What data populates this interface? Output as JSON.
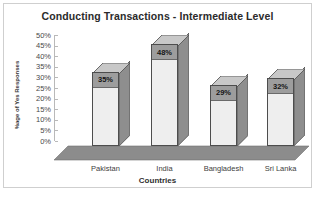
{
  "chart_data": {
    "type": "bar",
    "title": "Conducting Transactions - Intermediate Level",
    "xlabel": "Countries",
    "ylabel": "%age of Yes Responses",
    "categories": [
      "Pakistan",
      "India",
      "Bangladesh",
      "Sri Lanka"
    ],
    "values": [
      35,
      48,
      29,
      32
    ],
    "value_labels": [
      "35%",
      "48%",
      "29%",
      "32%"
    ],
    "ylim": [
      0,
      50
    ],
    "ytick_step": 5,
    "ytick_labels": [
      "50%",
      "45%",
      "40%",
      "35%",
      "30%",
      "25%",
      "20%",
      "15%",
      "10%",
      "5%",
      "0%"
    ],
    "grid": false,
    "legend": "none",
    "style": "3d-column",
    "colors": {
      "bar_front": "#eeeeee",
      "bar_side": "#8e8e8e",
      "bar_top": "#c8c8c8",
      "bar_outline": "#4d4d4d",
      "label_band": "#9d9d9d",
      "floor": "#8c8c8c",
      "axis": "#b9b9b9",
      "text": "#2b2b2b",
      "frame_border": "#cfcfcf",
      "background": "#ffffff"
    }
  }
}
